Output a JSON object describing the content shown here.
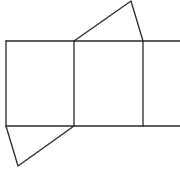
{
  "diagram": {
    "type": "geometric-net",
    "width": 180,
    "height": 172,
    "stroke_color": "#2a2a2a",
    "background": "#ffffff",
    "lines": {
      "top_edge": {
        "x1": 6,
        "y1": 41,
        "x2": 180,
        "y2": 41
      },
      "bottom_edge": {
        "x1": 6,
        "y1": 126,
        "x2": 180,
        "y2": 126
      },
      "left_edge": {
        "x1": 6,
        "y1": 41,
        "x2": 6,
        "y2": 126
      },
      "middle_edge": {
        "x1": 74,
        "y1": 41,
        "x2": 74,
        "y2": 126
      },
      "right_edge": {
        "x1": 143,
        "y1": 41,
        "x2": 143,
        "y2": 126
      }
    },
    "triangles": {
      "top": {
        "points": "74,41 131,1 143,41"
      },
      "bottom": {
        "points": "6,126 18,166 74,126"
      }
    }
  }
}
